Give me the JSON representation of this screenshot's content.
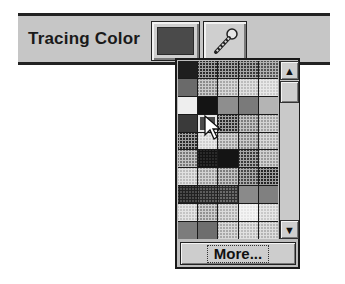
{
  "toolbar": {
    "label": "Tracing Color",
    "current_color": "#4a4a4a",
    "swatch_button": "color-swatch",
    "eyedropper_button": "eyedropper"
  },
  "palette": {
    "columns": 5,
    "selected_index": 16,
    "cells": [
      {
        "color": "#1e1e1e",
        "pattern": "none"
      },
      {
        "color": "#2a2a2a",
        "pattern": "dot"
      },
      {
        "color": "#333333",
        "pattern": "dot"
      },
      {
        "color": "#3a3a3a",
        "pattern": "dot"
      },
      {
        "color": "#555555",
        "pattern": "dot"
      },
      {
        "color": "#6a6a6a",
        "pattern": "none"
      },
      {
        "color": "#8a8a8a",
        "pattern": "dot"
      },
      {
        "color": "#a8a8a8",
        "pattern": "dot"
      },
      {
        "color": "#bbbbbb",
        "pattern": "dot"
      },
      {
        "color": "#cccccc",
        "pattern": "dot"
      },
      {
        "color": "#eeeeee",
        "pattern": "none"
      },
      {
        "color": "#141414",
        "pattern": "none"
      },
      {
        "color": "#8e8e8e",
        "pattern": "none"
      },
      {
        "color": "#7a7a7a",
        "pattern": "none"
      },
      {
        "color": "#b4b4b4",
        "pattern": "none"
      },
      {
        "color": "#3a3a3a",
        "pattern": "none"
      },
      {
        "color": "#4a4a4a",
        "pattern": "none"
      },
      {
        "color": "#2c2c2c",
        "pattern": "dot"
      },
      {
        "color": "#7a7a7a",
        "pattern": "dot"
      },
      {
        "color": "#a0a0a0",
        "pattern": "dot"
      },
      {
        "color": "#2a2a2a",
        "pattern": "dot"
      },
      {
        "color": "#cfcfcf",
        "pattern": "dot"
      },
      {
        "color": "#9a9a9a",
        "pattern": "dot"
      },
      {
        "color": "#888888",
        "pattern": "dot"
      },
      {
        "color": "#aaaaaa",
        "pattern": "dot"
      },
      {
        "color": "#777777",
        "pattern": "dot"
      },
      {
        "color": "#2a2a2a",
        "pattern": "dk"
      },
      {
        "color": "#141414",
        "pattern": "none"
      },
      {
        "color": "#3a3a3a",
        "pattern": "dot"
      },
      {
        "color": "#9a9a9a",
        "pattern": "dot"
      },
      {
        "color": "#bcbcbc",
        "pattern": "dot"
      },
      {
        "color": "#9c9c9c",
        "pattern": "dot"
      },
      {
        "color": "#7a7a7a",
        "pattern": "dot"
      },
      {
        "color": "#484848",
        "pattern": "dot"
      },
      {
        "color": "#262626",
        "pattern": "dot"
      },
      {
        "color": "#4a4a4a",
        "pattern": "dk"
      },
      {
        "color": "#5c5c5c",
        "pattern": "dk"
      },
      {
        "color": "#6a6a6a",
        "pattern": "dk"
      },
      {
        "color": "#8a8a8a",
        "pattern": "none"
      },
      {
        "color": "#808080",
        "pattern": "none"
      },
      {
        "color": "#c4c4c4",
        "pattern": "dot"
      },
      {
        "color": "#929292",
        "pattern": "dot"
      },
      {
        "color": "#b0b0b0",
        "pattern": "dot"
      },
      {
        "color": "#e6e6e6",
        "pattern": "dot"
      },
      {
        "color": "#c8c8c8",
        "pattern": "dot"
      },
      {
        "color": "#7c7c7c",
        "pattern": "none"
      },
      {
        "color": "#6e6e6e",
        "pattern": "none"
      },
      {
        "color": "#a8a8a8",
        "pattern": "dot"
      },
      {
        "color": "#bcbcbc",
        "pattern": "dot"
      },
      {
        "color": "#b4b4b4",
        "pattern": "dot"
      }
    ]
  },
  "scrollbar": {
    "up_arrow": "▲",
    "down_arrow": "▼"
  },
  "more_button": {
    "label": "More..."
  }
}
